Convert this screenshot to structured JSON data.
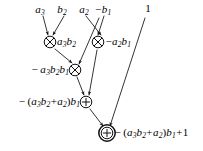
{
  "diagram": {
    "type": "dataflow-graph",
    "background_color": "#ffffff",
    "stroke_color": "#000000",
    "inputs": [
      {
        "id": "in-a3",
        "label_html": "a<sub>3</sub>",
        "text": "a3",
        "x": 40,
        "y": 9
      },
      {
        "id": "in-b2",
        "label_html": "b<sub>2</sub>",
        "text": "b2",
        "x": 62,
        "y": 9
      },
      {
        "id": "in-a2",
        "label_html": "a<sub>2</sub>",
        "text": "a2",
        "x": 84,
        "y": 9
      },
      {
        "id": "in-nb1",
        "label_html": "<span class=\"op\">−</span>b<sub>1</sub>",
        "text": "-b1",
        "x": 103,
        "y": 9
      },
      {
        "id": "in-one",
        "label_html": "<span class=\"num\">1</span>",
        "text": "1",
        "x": 148,
        "y": 8
      }
    ],
    "nodes": [
      {
        "id": "mul-1",
        "op": "multiply",
        "glyph": "⊗",
        "x": 50,
        "y": 42,
        "ring": "single",
        "label_html": "a<sub>3</sub>b<sub>2</sub>",
        "label_text": "a3b2",
        "label_side": "right"
      },
      {
        "id": "mul-2",
        "op": "multiply",
        "glyph": "⊗",
        "x": 98,
        "y": 42,
        "ring": "single",
        "label_html": "<span class=\"op\">−</span>a<sub>2</sub>b<sub>1</sub>",
        "label_text": "-a2b1",
        "label_side": "right"
      },
      {
        "id": "mul-3",
        "op": "multiply",
        "glyph": "⊗",
        "x": 75,
        "y": 70,
        "ring": "single",
        "label_html": "<span class=\"op\">−</span> a<sub>3</sub>b<sub>2</sub>b<sub>1</sub>",
        "label_text": "-a3b2b1",
        "label_side": "left"
      },
      {
        "id": "add-1",
        "op": "add",
        "glyph": "⊕",
        "x": 86,
        "y": 102,
        "ring": "single",
        "label_html": "<span class=\"op\">−</span> <span class=\"paren\">(</span>a<sub>3</sub>b<sub>2</sub><span class=\"op\">+</span>a<sub>2</sub><span class=\"paren\">)</span>b<sub>1</sub>",
        "label_text": "-(a3b2+a2)b1",
        "label_side": "left"
      },
      {
        "id": "add-out",
        "op": "add",
        "glyph": "⊕",
        "x": 107,
        "y": 133,
        "ring": "double",
        "label_html": "<span class=\"op\">−</span> <span class=\"paren\">(</span>a<sub>3</sub>b<sub>2</sub><span class=\"op\">+</span>a<sub>2</sub><span class=\"paren\">)</span>b<sub>1</sub><span class=\"op\">+</span><span class=\"num\">1</span>",
        "label_text": "-(a3b2+a2)b1+1",
        "label_side": "right"
      }
    ],
    "edges": [
      {
        "id": "e-a3-mul1",
        "from": "in-a3",
        "to": "mul-1",
        "x1": 43,
        "y1": 16,
        "x2": 48,
        "y2": 35
      },
      {
        "id": "e-b2-mul1",
        "from": "in-b2",
        "to": "mul-1",
        "x1": 64,
        "y1": 16,
        "x2": 53,
        "y2": 35
      },
      {
        "id": "e-a2-mul2",
        "from": "in-a2",
        "to": "mul-2",
        "x1": 86,
        "y1": 16,
        "x2": 101,
        "y2": 35
      },
      {
        "id": "e-nb1-mul2",
        "from": "in-nb1",
        "to": "mul-2",
        "x1": 104,
        "y1": 16,
        "x2": 98,
        "y2": 35
      },
      {
        "id": "e-nb1-mul3",
        "from": "in-nb1",
        "to": "mul-3",
        "x1": 99,
        "y1": 18,
        "x2": 79,
        "y2": 64
      },
      {
        "id": "e-mul1-mul3",
        "from": "mul-1",
        "to": "mul-3",
        "x1": 55,
        "y1": 49,
        "x2": 72,
        "y2": 63
      },
      {
        "id": "e-mul3-add1",
        "from": "mul-3",
        "to": "add-1",
        "x1": 77,
        "y1": 77,
        "x2": 84,
        "y2": 95
      },
      {
        "id": "e-mul2-add1",
        "from": "mul-2",
        "to": "add-1",
        "x1": 97,
        "y1": 50,
        "x2": 89,
        "y2": 95
      },
      {
        "id": "e-add1-out",
        "from": "add-1",
        "to": "add-out",
        "x1": 90,
        "y1": 109,
        "x2": 103,
        "y2": 126
      },
      {
        "id": "e-one-out",
        "from": "in-one",
        "to": "add-out",
        "x1": 145,
        "y1": 18,
        "x2": 110,
        "y2": 126
      }
    ]
  }
}
